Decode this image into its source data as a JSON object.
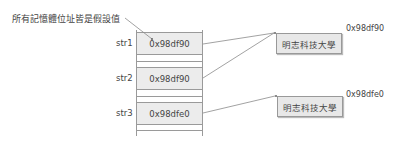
{
  "note": "所有記憶體位址皆是假設值",
  "memory": {
    "cells": [
      {
        "label": "str1",
        "value": "0x98df90"
      },
      {
        "label": "str2",
        "value": "0x98df90"
      },
      {
        "label": "str3",
        "value": "0x98dfe0"
      }
    ]
  },
  "targets": [
    {
      "text": "明志科技大學",
      "address": "0x98df90"
    },
    {
      "text": "明志科技大學",
      "address": "0x98dfe0"
    }
  ]
}
